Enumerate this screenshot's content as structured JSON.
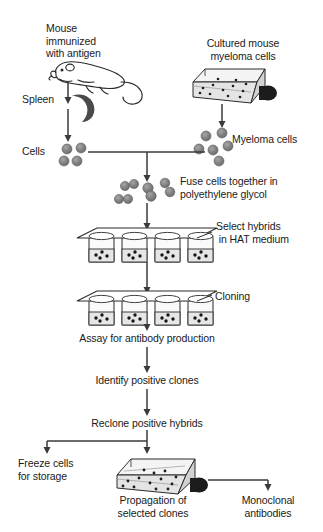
{
  "diagram": {
    "colors": {
      "background": "#ffffff",
      "text": "#1a1a1a",
      "line": "#3a3a3a",
      "cell_fill": "#7d7d7d",
      "cell_stroke": "#5a5a5a",
      "flask_fill": "#e8e8e8",
      "flask_cap": "#1c1c1c",
      "well_fill": "#ededed",
      "spleen_fill": "#4a4a4a"
    },
    "labels": [
      {
        "id": "mouse-immunized",
        "text": "Mouse\nimmunized\nwith antigen",
        "x": 46,
        "y": 22,
        "align": "left"
      },
      {
        "id": "cultured-myeloma",
        "text": "Cultured mouse\nmyeloma cells",
        "x": 243,
        "y": 37,
        "align": "center"
      },
      {
        "id": "spleen",
        "text": "Spleen",
        "x": 22,
        "y": 93,
        "align": "left"
      },
      {
        "id": "cells",
        "text": "Cells",
        "x": 22,
        "y": 145,
        "align": "left"
      },
      {
        "id": "myeloma-cells",
        "text": "Myeloma cells",
        "x": 232,
        "y": 133,
        "align": "left"
      },
      {
        "id": "fuse-cells",
        "text": "Fuse cells together in\npolyethylene glycol",
        "x": 180,
        "y": 175,
        "align": "left"
      },
      {
        "id": "select-hybrids",
        "text": "Select hybrids\n in HAT medium",
        "x": 216,
        "y": 220,
        "align": "left"
      },
      {
        "id": "cloning",
        "text": "Cloning",
        "x": 215,
        "y": 290,
        "align": "left"
      },
      {
        "id": "assay-antibody",
        "text": "Assay for antibody production",
        "x": 147,
        "y": 332,
        "align": "center"
      },
      {
        "id": "identify-clones",
        "text": "Identify positive clones",
        "x": 147,
        "y": 374,
        "align": "center"
      },
      {
        "id": "reclone-hybrids",
        "text": "Reclone positive hybrids",
        "x": 147,
        "y": 417,
        "align": "center"
      },
      {
        "id": "freeze-cells",
        "text": "Freeze cells\nfor storage",
        "x": 18,
        "y": 457,
        "align": "left"
      },
      {
        "id": "propagation-clones",
        "text": "Propagation of\nselected clones",
        "x": 153,
        "y": 494,
        "align": "center"
      },
      {
        "id": "monoclonal-antibodies",
        "text": "Monoclonal\nantibodies",
        "x": 268,
        "y": 494,
        "align": "center"
      }
    ],
    "steps": [
      "Mouse immunized with antigen",
      "Spleen",
      "Cells",
      "Cultured mouse myeloma cells",
      "Myeloma cells",
      "Fuse cells together in polyethylene glycol",
      "Select hybrids in HAT medium",
      "Cloning",
      "Assay for antibody production",
      "Identify positive clones",
      "Reclone positive hybrids",
      "Freeze cells for storage",
      "Propagation of selected clones",
      "Monoclonal antibodies"
    ],
    "figures": {
      "mouse_icon": "mouse-outline",
      "spleen_icon": "spleen-crescent",
      "top_flask_icon": "culture-flask",
      "bottom_flask_icon": "culture-flask",
      "tray_icon": "well-plate-tray",
      "spleen_cell_count": 4,
      "myeloma_cell_count": 6,
      "fused_cell_count": 6,
      "wells_per_tray": 4,
      "tray_count": 2
    }
  }
}
